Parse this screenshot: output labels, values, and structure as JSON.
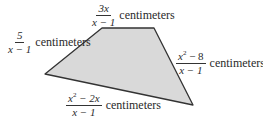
{
  "diagram": {
    "shape": "quadrilateral",
    "fill_color": "#d9d9d9",
    "stroke_color": "#333333",
    "vertices": [
      [
        102,
        28
      ],
      [
        154,
        28
      ],
      [
        193,
        105
      ],
      [
        45,
        74
      ]
    ],
    "unit": "centimeters",
    "sides": [
      {
        "name": "top",
        "numerator": "3x",
        "denominator": "x − 1",
        "unit": "centimeters"
      },
      {
        "name": "left",
        "numerator": "5",
        "denominator": "x − 1",
        "unit": "centimeters"
      },
      {
        "name": "right",
        "numerator_base": "x",
        "numerator_exp": "2",
        "numerator_rest": " − 8",
        "denominator": "x − 1",
        "unit": "centimeters"
      },
      {
        "name": "bottom",
        "numerator_base": "x",
        "numerator_exp": "2",
        "numerator_rest": " − 2x",
        "denominator": "x − 1",
        "unit": "centimeters"
      }
    ]
  }
}
